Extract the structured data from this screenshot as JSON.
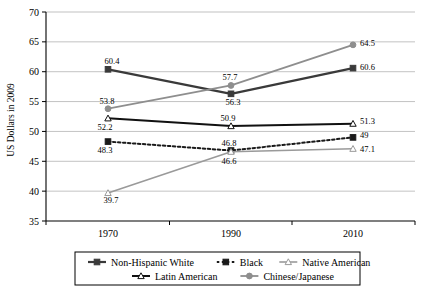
{
  "chart_data": {
    "type": "line",
    "title": "",
    "xlabel": "",
    "ylabel": "US Dollars in 2009",
    "x": [
      "1970",
      "1990",
      "2010"
    ],
    "categories": [
      "1970",
      "1990",
      "2010"
    ],
    "ylim": [
      35,
      70
    ],
    "yticks": [
      35,
      40,
      45,
      50,
      55,
      60,
      65,
      70
    ],
    "ytick_labels": [
      "35",
      "40",
      "45",
      "50",
      "55",
      "60",
      "65",
      "70"
    ],
    "grid": true,
    "legend_position": "bottom",
    "series": [
      {
        "name": "Non-Hispanic White",
        "values": [
          60.4,
          56.3,
          60.6
        ],
        "labels": [
          "60.4",
          "56.3",
          "60.6"
        ],
        "color": "#3a3a3a",
        "marker": "square",
        "marker_fill": "#3a3a3a",
        "dash": "none",
        "width": 2.2
      },
      {
        "name": "Black",
        "values": [
          48.3,
          46.8,
          49.0
        ],
        "labels": [
          "48.3",
          "46.8",
          "49"
        ],
        "color": "#1a1a1a",
        "marker": "square",
        "marker_fill": "#1a1a1a",
        "dash": "2.5,2.5",
        "width": 2.0
      },
      {
        "name": "Native American",
        "values": [
          39.7,
          46.6,
          47.1
        ],
        "labels": [
          "39.7",
          "46.6",
          "47.1"
        ],
        "color": "#9a9a9a",
        "marker": "triangle",
        "marker_fill": "#ffffff",
        "dash": "none",
        "width": 1.6
      },
      {
        "name": "Latin American",
        "values": [
          52.2,
          50.9,
          51.3
        ],
        "labels": [
          "52.2",
          "50.9",
          "51.3"
        ],
        "color": "#111111",
        "marker": "triangle",
        "marker_fill": "#ffffff",
        "dash": "none",
        "width": 2.0
      },
      {
        "name": "Chinese/Japanese",
        "values": [
          53.8,
          57.7,
          64.5
        ],
        "labels": [
          "53.8",
          "57.7",
          "64.5"
        ],
        "color": "#8e8e8e",
        "marker": "circle",
        "marker_fill": "#8e8e8e",
        "dash": "none",
        "width": 1.8
      }
    ],
    "point_label_offsets": [
      [
        {
          "dx": 4,
          "dy": -5
        },
        {
          "dx": 2,
          "dy": 11
        },
        {
          "dx": 7,
          "dy": 2
        }
      ],
      [
        {
          "dx": -3,
          "dy": 11
        },
        {
          "dx": -2,
          "dy": -5
        },
        {
          "dx": 7,
          "dy": 1
        }
      ],
      [
        {
          "dx": 3,
          "dy": 10
        },
        {
          "dx": -2,
          "dy": 12
        },
        {
          "dx": 7,
          "dy": 3
        }
      ],
      [
        {
          "dx": -3,
          "dy": 12
        },
        {
          "dx": -3,
          "dy": -5
        },
        {
          "dx": 7,
          "dy": 0
        }
      ],
      [
        {
          "dx": -1,
          "dy": -5
        },
        {
          "dx": -1,
          "dy": -5
        },
        {
          "dx": 7,
          "dy": 1
        }
      ]
    ]
  },
  "legend": {
    "row1": [
      "Non-Hispanic White",
      "Black",
      "Native American"
    ],
    "row2": [
      "Latin American",
      "Chinese/Japanese"
    ]
  },
  "axis": {
    "y_title": "US Dollars in 2009",
    "y_ticks": [
      "70",
      "65",
      "60",
      "55",
      "50",
      "45",
      "40",
      "35"
    ],
    "x_ticks": [
      "1970",
      "1990",
      "2010"
    ]
  }
}
